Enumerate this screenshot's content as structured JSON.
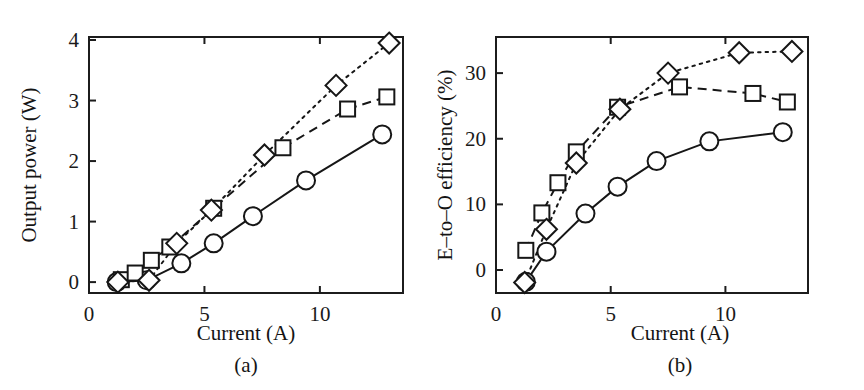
{
  "figure": {
    "background": "#ffffff",
    "ink_color": "#161616"
  },
  "chart_data": [
    {
      "id": "panel-a",
      "type": "line",
      "title": "",
      "panel_label": "(a)",
      "xlabel": "Current (A)",
      "ylabel": "Output power (W)",
      "xlim": [
        0,
        13.6
      ],
      "ylim": [
        -0.18,
        4.05
      ],
      "xticks": [
        0,
        5,
        10
      ],
      "yticks": [
        0,
        1,
        2,
        3,
        4
      ],
      "xticklabels": [
        "0",
        "5",
        "10"
      ],
      "yticklabels": [
        "0",
        "1",
        "2",
        "3",
        "4"
      ],
      "grid": false,
      "legend": "none",
      "series": [
        {
          "name": "circle-series",
          "marker": "circle",
          "linestyle": "solid",
          "x": [
            1.2,
            2.5,
            4.0,
            5.4,
            7.1,
            9.4,
            12.7
          ],
          "y": [
            0.0,
            0.03,
            0.31,
            0.64,
            1.09,
            1.68,
            2.44
          ]
        },
        {
          "name": "square-series",
          "marker": "square",
          "linestyle": "dashed",
          "x": [
            1.4,
            2.0,
            2.7,
            3.5,
            5.4,
            8.4,
            11.2,
            12.9
          ],
          "y": [
            0.04,
            0.15,
            0.36,
            0.58,
            1.22,
            2.22,
            2.86,
            3.06
          ]
        },
        {
          "name": "diamond-series",
          "marker": "diamond",
          "linestyle": "dotted",
          "x": [
            1.25,
            2.6,
            3.8,
            5.3,
            7.6,
            10.7,
            13.0
          ],
          "y": [
            0.0,
            0.03,
            0.64,
            1.19,
            2.1,
            3.25,
            3.95
          ]
        }
      ]
    },
    {
      "id": "panel-b",
      "type": "line",
      "title": "",
      "panel_label": "(b)",
      "xlabel": "Current (A)",
      "ylabel": "E–to–O efficiency (%)",
      "xlim": [
        0,
        13.6
      ],
      "ylim": [
        -3.5,
        35.5
      ],
      "xticks": [
        0,
        5,
        10
      ],
      "yticks": [
        0,
        10,
        20,
        30
      ],
      "xticklabels": [
        "0",
        "5",
        "10"
      ],
      "yticklabels": [
        "0",
        "10",
        "20",
        "30"
      ],
      "grid": false,
      "legend": "none",
      "series": [
        {
          "name": "circle-series",
          "marker": "circle",
          "linestyle": "solid",
          "x": [
            1.3,
            2.2,
            3.9,
            5.3,
            7.0,
            9.3,
            12.5
          ],
          "y": [
            -1.8,
            2.8,
            8.6,
            12.7,
            16.6,
            19.6,
            21.0
          ]
        },
        {
          "name": "square-series",
          "marker": "square",
          "linestyle": "dashed",
          "x": [
            1.3,
            2.0,
            2.7,
            3.5,
            5.3,
            8.0,
            11.2,
            12.7
          ],
          "y": [
            3.0,
            8.7,
            13.3,
            18.0,
            24.8,
            27.9,
            26.9,
            25.6
          ]
        },
        {
          "name": "diamond-series",
          "marker": "diamond",
          "linestyle": "dotted",
          "x": [
            1.25,
            2.2,
            3.5,
            5.4,
            7.5,
            10.6,
            12.9
          ],
          "y": [
            -1.9,
            6.2,
            16.3,
            24.5,
            30.0,
            33.1,
            33.3
          ]
        }
      ]
    }
  ]
}
